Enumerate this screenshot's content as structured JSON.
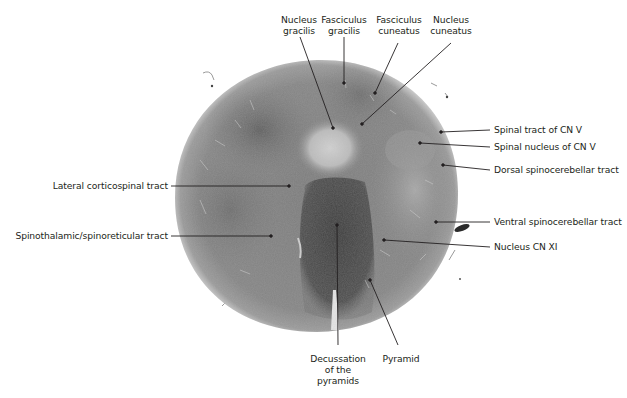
{
  "figure": {
    "type": "histology-section",
    "colors": {
      "background": "#ffffff",
      "tissue_outer": "#8a8a8a",
      "tissue_mid": "#7a7a7a",
      "tissue_dark": "#4a4a4a",
      "pale_region": "#c4c4c4",
      "leader_line": "#231f20",
      "text": "#231f20"
    }
  },
  "labels": {
    "top": [
      {
        "id": "nucleus-gracilis",
        "line1": "Nucleus",
        "line2": "gracilis"
      },
      {
        "id": "fasciculus-gracilis",
        "line1": "Fasciculus",
        "line2": "gracilis"
      },
      {
        "id": "fasciculus-cuneatus",
        "line1": "Fasciculus",
        "line2": "cuneatus"
      },
      {
        "id": "nucleus-cuneatus",
        "line1": "Nucleus",
        "line2": "cuneatus"
      }
    ],
    "right": [
      {
        "id": "spinal-tract-cn-v",
        "text": "Spinal tract of CN V"
      },
      {
        "id": "spinal-nucleus-cn-v",
        "text": "Spinal nucleus of CN V"
      },
      {
        "id": "dorsal-spinocerebellar",
        "text": "Dorsal spinocerebellar tract"
      },
      {
        "id": "ventral-spinocerebellar",
        "text": "Ventral spinocerebellar tract"
      },
      {
        "id": "nucleus-cn-xi",
        "text": "Nucleus CN XI"
      }
    ],
    "left": [
      {
        "id": "lateral-corticospinal",
        "text": "Lateral corticospinal tract"
      },
      {
        "id": "spinothalamic",
        "text": "Spinothalamic/spinoreticular tract"
      }
    ],
    "bottom": [
      {
        "id": "decussation",
        "line1": "Decussation",
        "line2": "of the",
        "line3": "pyramids"
      },
      {
        "id": "pyramid",
        "text": "Pyramid"
      }
    ]
  }
}
